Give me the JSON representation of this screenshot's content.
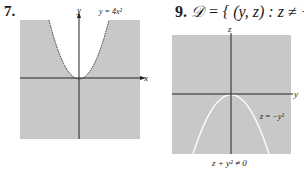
{
  "problems": [
    {
      "number": "7.",
      "curve_label": "y = 4x²",
      "x_axis_label": "x",
      "y_axis_label": "y",
      "boundary_style": "dashed",
      "shaded": "outside parabola (below/right of curve)",
      "fill_color": "#c8c8c8",
      "curve_color": "#333333"
    },
    {
      "number": "9.",
      "domain_symbol": "𝒟",
      "domain_text": " = { (y, z) : z ≠ −y² }",
      "x_axis_label": "y",
      "y_axis_label": "z",
      "curve_label": "z = −y²",
      "caption": "z + y² ≠ 0",
      "shaded": "entire plane except curve",
      "fill_color": "#c8c8c8",
      "curve_color": "#ffffff"
    }
  ]
}
